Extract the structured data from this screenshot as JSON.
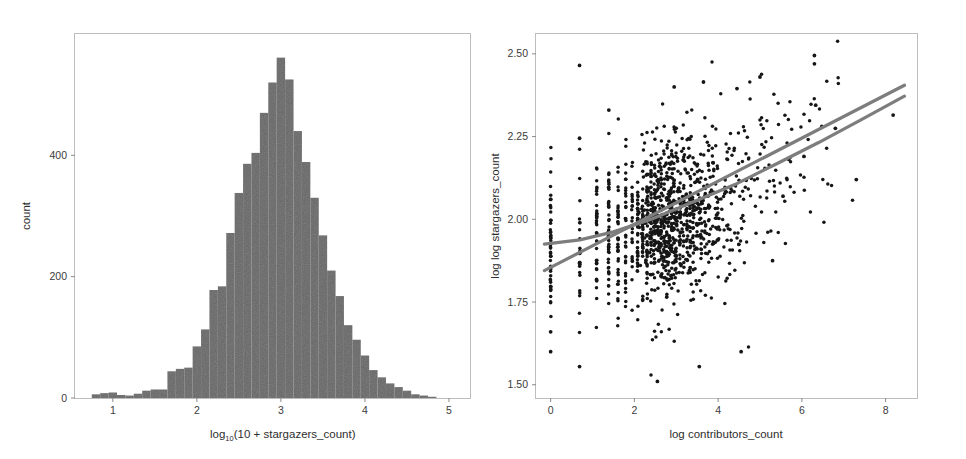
{
  "figure": {
    "background_color": "#ffffff",
    "panel_border_color": "#bdbdbd",
    "tick_color": "#8a8a8a",
    "text_color": "#3a3a3a"
  },
  "left_chart": {
    "name": "stargazers-histogram",
    "xlabel_main": "log",
    "xlabel_sub": "10",
    "xlabel_rest": "(10 + stargazers_count)",
    "ylabel": "count",
    "x_ticks": [
      "1",
      "2",
      "3",
      "4",
      "5"
    ],
    "y_ticks": [
      "0",
      "200",
      "400"
    ],
    "bar_color": "#666666"
  },
  "right_chart": {
    "name": "contributors-vs-stargazers-scatter",
    "xlabel": "log contributors_count",
    "ylabel": "log log stargazers_count",
    "x_ticks": [
      "0",
      "2",
      "4",
      "6",
      "8"
    ],
    "y_ticks": [
      "1.50",
      "1.75",
      "2.00",
      "2.25",
      "2.50"
    ],
    "point_color": "#161616",
    "line_color": "#7d7d7d"
  },
  "chart_data": [
    {
      "type": "bar",
      "name": "histogram-log10-stargazers",
      "title": "",
      "xlabel": "log10(10 + stargazers_count)",
      "ylabel": "count",
      "xlim": [
        0.55,
        5.25
      ],
      "ylim": [
        0,
        600
      ],
      "y_ticks": [
        0,
        200,
        400
      ],
      "x_ticks": [
        1,
        2,
        3,
        4,
        5
      ],
      "grid": false,
      "legend": "none",
      "bin_width": 0.1,
      "bin_left_edges": [
        0.75,
        0.85,
        0.95,
        1.05,
        1.15,
        1.25,
        1.35,
        1.45,
        1.55,
        1.65,
        1.75,
        1.85,
        1.95,
        2.05,
        2.15,
        2.25,
        2.35,
        2.45,
        2.55,
        2.65,
        2.75,
        2.85,
        2.95,
        3.05,
        3.15,
        3.25,
        3.35,
        3.45,
        3.55,
        3.65,
        3.75,
        3.85,
        3.95,
        4.05,
        4.15,
        4.25,
        4.35,
        4.45,
        4.55,
        4.65,
        4.75
      ],
      "values": [
        6,
        8,
        9,
        5,
        4,
        7,
        12,
        14,
        14,
        44,
        48,
        50,
        85,
        113,
        178,
        184,
        272,
        338,
        386,
        404,
        470,
        520,
        561,
        525,
        440,
        389,
        330,
        268,
        210,
        168,
        120,
        96,
        70,
        46,
        34,
        24,
        18,
        12,
        6,
        4,
        2
      ]
    },
    {
      "type": "scatter",
      "name": "scatter-contributors-vs-stargazers",
      "title": "",
      "xlabel": "log contributors_count",
      "ylabel": "log log stargazers_count",
      "xlim": [
        -0.35,
        8.75
      ],
      "ylim": [
        1.46,
        2.56
      ],
      "x_ticks": [
        0,
        2,
        4,
        6,
        8
      ],
      "y_ticks": [
        1.5,
        1.75,
        2.0,
        2.25,
        2.5
      ],
      "grid": false,
      "legend": "none",
      "n_points": 1300,
      "point_color": "#161616",
      "overlays": [
        {
          "kind": "line",
          "name": "linear-fit",
          "style": "straight",
          "color": "#7d7d7d",
          "x": [
            -0.15,
            8.45
          ],
          "y": [
            1.845,
            2.405
          ]
        },
        {
          "kind": "line",
          "name": "loess-fit",
          "style": "smooth",
          "color": "#7d7d7d",
          "x": [
            -0.15,
            0.7,
            1.5,
            2.4,
            3.4,
            4.4,
            5.4,
            6.4,
            7.4,
            8.45
          ],
          "y": [
            1.925,
            1.938,
            1.962,
            2.0,
            2.052,
            2.105,
            2.168,
            2.232,
            2.3,
            2.372
          ]
        }
      ]
    }
  ]
}
